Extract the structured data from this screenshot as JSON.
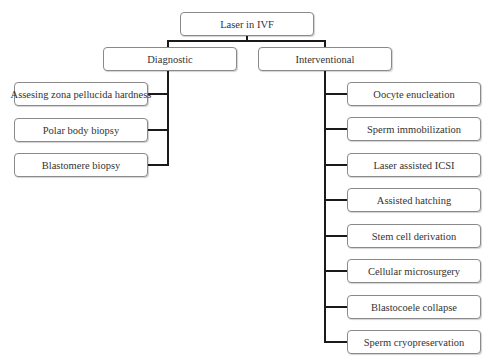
{
  "diagram": {
    "root": {
      "label": "Laser in IVF"
    },
    "branches": [
      {
        "label": "Diagnostic",
        "children": [
          "Assesing zona pellucida hardness",
          "Polar body biopsy",
          "Blastomere biopsy"
        ]
      },
      {
        "label": "Interventional",
        "children": [
          "Oocyte enucleation",
          "Sperm immobilization",
          "Laser assisted ICSI",
          "Assisted hatching",
          "Stem cell derivation",
          "Cellular microsurgery",
          "Blastocoele collapse",
          "Sperm cryopreservation"
        ]
      }
    ]
  },
  "colors": {
    "box_border": "#8a8a8a",
    "connector": "#1a1a1a",
    "text": "#333333",
    "background": "#ffffff"
  }
}
